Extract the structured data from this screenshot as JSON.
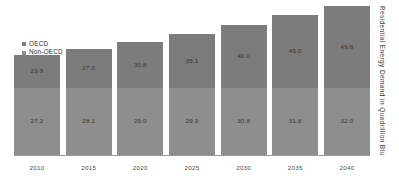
{
  "chart_data": {
    "type": "bar",
    "title": "",
    "subtitle": "",
    "xlabel": "",
    "ylabel": "Residential Energy Demand in Quadrillion Btu",
    "stacked": true,
    "grid": false,
    "legend_position": "top-left",
    "ylim": [
      0,
      52
    ],
    "categories": [
      "2010",
      "2015",
      "2020",
      "2025",
      "2030",
      "2035",
      "2040"
    ],
    "series": [
      {
        "name": "OECD",
        "color": "#7c7c7c",
        "values": [
          23.9,
          27.0,
          30.8,
          35.1,
          40.0,
          45.0,
          49.8
        ],
        "labels": [
          "23.9",
          "27.0",
          "30.8",
          "35.1",
          "40.0",
          "45.0",
          "49.8"
        ]
      },
      {
        "name": "Non-OECD",
        "color": "#8e8e8e",
        "values": [
          27.2,
          28.1,
          29.0,
          29.9,
          30.8,
          31.8,
          32.0
        ],
        "labels": [
          "27.2",
          "28.1",
          "29.0",
          "29.9",
          "30.8",
          "31.8",
          "32.0"
        ]
      }
    ]
  },
  "legend": {
    "items": [
      {
        "label": "OECD",
        "color": "#7c7c7c",
        "marker": "square-marker-icon"
      },
      {
        "label": "Non-OECD",
        "color": "#8e8e8e",
        "marker": "square-marker-icon"
      }
    ]
  },
  "axis": {
    "y_title": "Residential Energy Demand in Quadrillion Btu",
    "x_ticks": [
      "2010",
      "2015",
      "2020",
      "2025",
      "2030",
      "2035",
      "2040"
    ]
  },
  "colors": {
    "background": "#ffffff",
    "oecd": "#7c7c7c",
    "non_oecd": "#8e8e8e",
    "baseline": "#9a9a9a",
    "label_text": "#2b2b2b",
    "tick_text": "#4a4a4a"
  }
}
